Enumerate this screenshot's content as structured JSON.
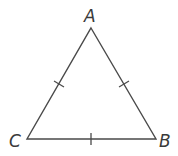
{
  "diagram": {
    "type": "triangle",
    "vertices": [
      {
        "label": "A",
        "x": 91,
        "y": 28
      },
      {
        "label": "B",
        "x": 156,
        "y": 139
      },
      {
        "label": "C",
        "x": 27,
        "y": 139
      }
    ],
    "sides": [
      {
        "name": "AC",
        "tick_marks": 1
      },
      {
        "name": "AB",
        "tick_marks": 1
      },
      {
        "name": "CB",
        "tick_marks": 1
      }
    ],
    "labels": {
      "a": "A",
      "b": "B",
      "c": "C"
    },
    "colors": {
      "stroke": "#4a4a4a",
      "label": "#3a3a3a",
      "background": "#ffffff"
    }
  }
}
